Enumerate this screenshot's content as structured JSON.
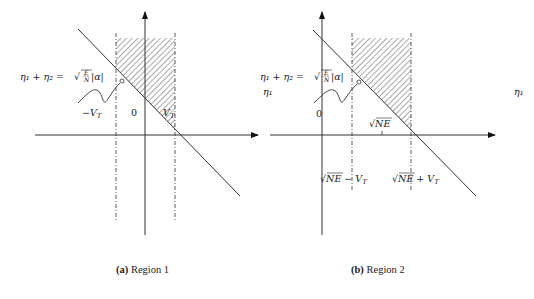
{
  "figure": {
    "panels": [
      {
        "id": "a",
        "caption_tag": "(a)",
        "caption_text": " Region 1",
        "equation": {
          "lhs": "η₁ + η₂ = ",
          "sqrt_num": "E",
          "sqrt_den": "N",
          "rhs": "|α|"
        },
        "labels": {
          "left_region": "−V",
          "left_region_sub": "T",
          "mid_region": "0",
          "right_region": "V",
          "right_region_sub": "T"
        },
        "right_edge_label": "η₁"
      },
      {
        "id": "b",
        "caption_tag": "(b)",
        "caption_text": " Region 2",
        "equation": {
          "lhs": "η₁ + η₂ = ",
          "sqrt_num": "E",
          "sqrt_den": "N",
          "rhs": "|α|"
        },
        "labels": {
          "eta_left": "η₁",
          "origin": "0",
          "tick": "NE",
          "left_dash": "NE − V",
          "left_dash_sub": "T",
          "right_dash": "NE + V",
          "right_dash_sub": "T",
          "eta_right": "η₁"
        }
      }
    ]
  }
}
